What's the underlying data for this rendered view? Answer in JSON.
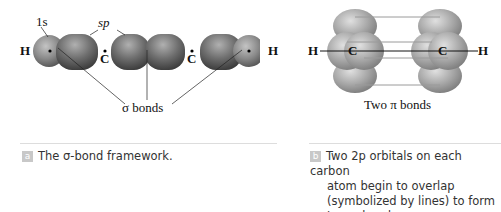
{
  "panel_a": {
    "labels": {
      "h_left": "H",
      "h_right": "H",
      "c_left": "C",
      "c_right": "C",
      "orbital_1s": "1s",
      "orbital_sp": "sp",
      "sigma_bonds": "σ bonds"
    },
    "caption_tag": "a",
    "caption": "The σ-bond framework."
  },
  "panel_b": {
    "labels": {
      "h_left": "H",
      "h_right": "H",
      "c_left": "C",
      "c_right": "C",
      "pi_bonds": "Two π bonds"
    },
    "caption_tag": "b",
    "caption_lines": [
      "Two 2p orbitals on each carbon",
      "atom begin to overlap",
      "(symbolized by lines) to form",
      "two π bonds."
    ]
  },
  "colors": {
    "orbital_dark": "#6e6e6e",
    "orbital_light": "#a8a8a8",
    "pi_line": "#9a9a9a",
    "tag_bg": "#c8c8c8"
  }
}
